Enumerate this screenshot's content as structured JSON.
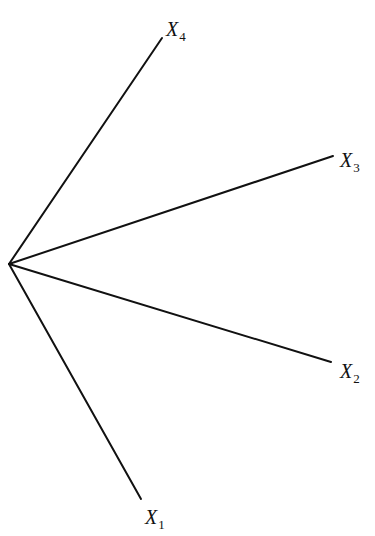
{
  "diagram": {
    "type": "star-rays",
    "origin": {
      "x": 9,
      "y": 264
    },
    "line_color": "#111111",
    "rays": [
      {
        "label": "X",
        "subscript": "4",
        "end": {
          "x": 162,
          "y": 38
        },
        "label_pos": {
          "x": 166,
          "y": 36
        }
      },
      {
        "label": "X",
        "subscript": "3",
        "end": {
          "x": 333,
          "y": 156
        },
        "label_pos": {
          "x": 340,
          "y": 167
        }
      },
      {
        "label": "X",
        "subscript": "2",
        "end": {
          "x": 331,
          "y": 362
        },
        "label_pos": {
          "x": 340,
          "y": 378
        }
      },
      {
        "label": "X",
        "subscript": "1",
        "end": {
          "x": 141,
          "y": 499
        },
        "label_pos": {
          "x": 145,
          "y": 524
        }
      }
    ]
  }
}
